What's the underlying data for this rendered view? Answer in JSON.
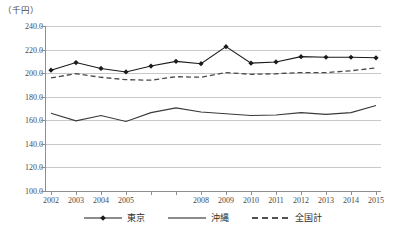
{
  "chart_data": {
    "type": "line",
    "title": "",
    "subtitle": "",
    "unit_label": "（千円）",
    "xlabel": "",
    "ylabel": "",
    "ylim": [
      100.0,
      240.0
    ],
    "ytick_step": 20.0,
    "ytick_labels": [
      "240.0",
      "220.0",
      "200.0",
      "180.0",
      "160.0",
      "140.0",
      "120.0",
      "100.0"
    ],
    "ytick_values": [
      240.0,
      220.0,
      200.0,
      180.0,
      160.0,
      140.0,
      120.0,
      100.0
    ],
    "grid": true,
    "grid_axis": "y",
    "legend_position": "bottom",
    "x": [
      2002,
      2003,
      2004,
      2005,
      2006,
      2007,
      2008,
      2009,
      2010,
      2011,
      2012,
      2013,
      2014,
      2015
    ],
    "categories": [
      "2002",
      "2003",
      "2004",
      "2005",
      "2006",
      "2007",
      "2008",
      "2009",
      "2010",
      "2011",
      "2012",
      "2013",
      "2014",
      "2015"
    ],
    "xtick_labels": [
      "2002",
      "2003",
      "2004",
      "2005",
      "",
      "",
      "2008",
      "2009",
      "2010",
      "2011",
      "2012",
      "2013",
      "2014",
      "2015"
    ],
    "series": [
      {
        "name": "東京",
        "style": "solid-marker",
        "marker": "diamond",
        "color": "#1a1a1a",
        "values": [
          202.5,
          209.0,
          204.0,
          201.0,
          206.0,
          210.0,
          208.0,
          222.5,
          208.5,
          209.5,
          214.0,
          213.5,
          213.5,
          213.0
        ]
      },
      {
        "name": "沖縄",
        "style": "solid",
        "marker": "none",
        "color": "#3a3a3a",
        "values": [
          166.0,
          159.5,
          164.0,
          159.0,
          166.5,
          170.5,
          167.0,
          165.5,
          164.0,
          164.5,
          166.5,
          165.0,
          166.5,
          172.5
        ]
      },
      {
        "name": "全国計",
        "style": "dashed",
        "marker": "none",
        "color": "#4a4a4a",
        "values": [
          196.0,
          199.5,
          196.5,
          194.5,
          194.0,
          197.0,
          196.5,
          200.5,
          199.0,
          199.5,
          200.5,
          200.5,
          202.0,
          204.5
        ]
      }
    ],
    "legend": [
      {
        "label": "東京",
        "style": "solid-marker",
        "marker": "diamond"
      },
      {
        "label": "沖縄",
        "style": "solid",
        "marker": "none"
      },
      {
        "label": "全国計",
        "style": "dashed",
        "marker": "none"
      }
    ]
  }
}
